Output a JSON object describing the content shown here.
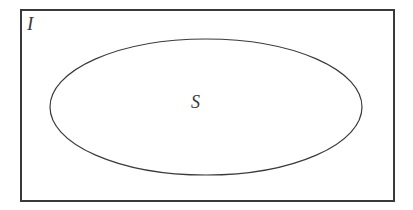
{
  "figure": {
    "kind": "set-diagram",
    "background_color": "#ffffff",
    "stroke_color": "#3a3a3a",
    "width": 413,
    "height": 210
  },
  "universe": {
    "label": "I",
    "shape": "rectangle",
    "x": 21,
    "y": 10,
    "width": 373,
    "height": 191,
    "stroke_width": 1.4,
    "label_x": 32,
    "label_y": 24
  },
  "subset": {
    "label": "S",
    "shape": "ellipse",
    "cx": 206,
    "cy": 107,
    "rx": 156,
    "ry": 68,
    "stroke_width": 1.2,
    "label_x": 198,
    "label_y": 104
  }
}
